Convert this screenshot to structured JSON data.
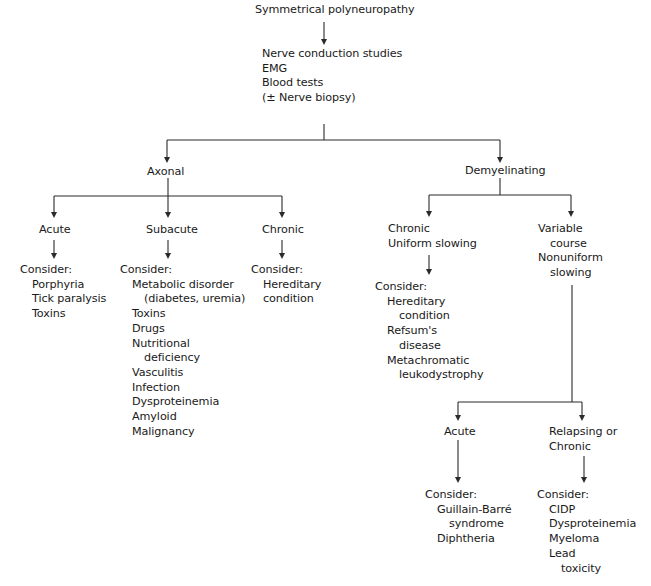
{
  "diagram": {
    "root": "Symmetrical polyneuropathy",
    "tests": [
      "Nerve conduction studies",
      "EMG",
      "Blood tests",
      "(± Nerve biopsy)"
    ],
    "axonal": {
      "label": "Axonal",
      "acute": {
        "label": "Acute",
        "consider": "Consider:",
        "items": [
          "Porphyria",
          "Tick paralysis",
          "Toxins"
        ]
      },
      "subacute": {
        "label": "Subacute",
        "consider": "Consider:",
        "items": [
          "Metabolic disorder",
          "(diabetes, uremia)",
          "Toxins",
          "Drugs",
          "Nutritional",
          "deficiency",
          "Vasculitis",
          "Infection",
          "Dysproteinemia",
          "Amyloid",
          "Malignancy"
        ]
      },
      "chronic": {
        "label": "Chronic",
        "consider": "Consider:",
        "items": [
          "Hereditary",
          "condition"
        ]
      }
    },
    "demyelinating": {
      "label": "Demyelinating",
      "chronic": {
        "label": [
          "Chronic",
          "Uniform slowing"
        ],
        "consider": "Consider:",
        "items": [
          "Hereditary",
          "condition",
          "Refsum's",
          "disease",
          "Metachromatic",
          "leukodystrophy"
        ]
      },
      "variable": {
        "label": [
          "Variable",
          "course",
          "Nonuniform",
          "slowing"
        ]
      },
      "acute": {
        "label": "Acute",
        "consider": "Consider:",
        "items": [
          "Guillain-Barré",
          "syndrome",
          "Diphtheria"
        ]
      },
      "relapsing": {
        "label": [
          "Relapsing or",
          "Chronic"
        ],
        "consider": "Consider:",
        "items": [
          "CIDP",
          "Dysproteinemia",
          "Myeloma",
          "Lead",
          "toxicity"
        ]
      }
    }
  }
}
